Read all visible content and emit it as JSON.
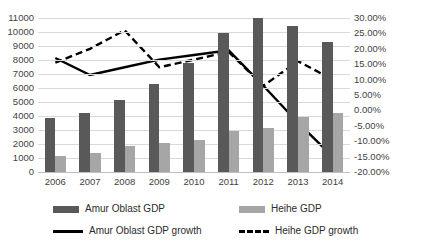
{
  "chart_data": {
    "type": "bar",
    "title": "",
    "subtitle": "",
    "xlabel": "",
    "ylabel": "",
    "grid": true,
    "legend_position": "bottom",
    "categories": [
      "2006",
      "2007",
      "2008",
      "2009",
      "2010",
      "2011",
      "2012",
      "2013",
      "2014"
    ],
    "y_left": {
      "label": "",
      "ylim": [
        0,
        11000
      ],
      "tick_step": 1000,
      "ticks": [
        "0",
        "1000",
        "2000",
        "3000",
        "4000",
        "5000",
        "6000",
        "7000",
        "8000",
        "9000",
        "10000",
        "11000"
      ],
      "tick_values": [
        0,
        1000,
        2000,
        3000,
        4000,
        5000,
        6000,
        7000,
        8000,
        9000,
        10000,
        11000
      ]
    },
    "y_right": {
      "label": "",
      "ylim": [
        -20,
        30
      ],
      "tick_step": 5,
      "ticks": [
        "-20.00%",
        "-15.00%",
        "-10.00%",
        "-5.00%",
        "0.00%",
        "5.00%",
        "10.00%",
        "15.00%",
        "20.00%",
        "25.00%",
        "30.00%"
      ],
      "tick_values": [
        -20,
        -15,
        -10,
        -5,
        0,
        5,
        10,
        15,
        20,
        25,
        30
      ]
    },
    "series": [
      {
        "name": "Amur Oblast GDP",
        "kind": "bar",
        "axis": "left",
        "color": "#595959",
        "values": [
          3850,
          4250,
          5150,
          6300,
          7800,
          9900,
          11000,
          10400,
          9300
        ]
      },
      {
        "name": "Heihe GDP",
        "kind": "bar",
        "axis": "left",
        "color": "#a6a6a6",
        "values": [
          1150,
          1350,
          1850,
          2100,
          2300,
          2900,
          3150,
          3950,
          4200
        ]
      },
      {
        "name": "Amur Oblast GDP growth",
        "kind": "line",
        "style": "solid",
        "axis": "right",
        "color": "#000000",
        "values": [
          17.0,
          11.5,
          14.0,
          16.5,
          18.0,
          19.5,
          8.0,
          -4.0,
          -15.0
        ]
      },
      {
        "name": "Heihe GDP growth",
        "kind": "line",
        "style": "dashed",
        "axis": "right",
        "color": "#000000",
        "values": [
          15.5,
          20.0,
          26.0,
          14.0,
          16.5,
          19.0,
          8.0,
          16.0,
          10.0
        ]
      }
    ]
  },
  "legend": {
    "items": [
      {
        "label": "Amur Oblast GDP",
        "marker": "swatch-dark"
      },
      {
        "label": "Heihe GDP",
        "marker": "swatch-light"
      },
      {
        "label": "Amur Oblast GDP growth",
        "marker": "line-solid"
      },
      {
        "label": "Heihe GDP growth",
        "marker": "line-dashed"
      }
    ]
  }
}
